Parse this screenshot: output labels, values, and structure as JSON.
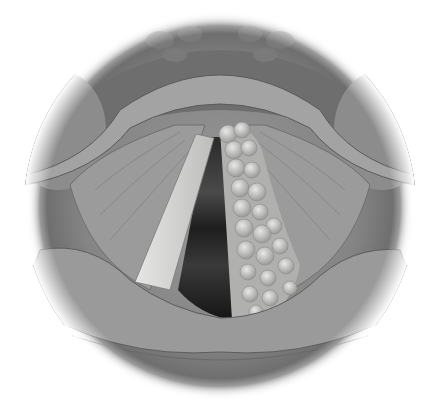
{
  "image": {
    "subject": "larynx-endoscopic-view",
    "description": "Grayscale medical illustration of vocal cords viewed from above; left vocal fold smooth and pale, right vocal fold covered by a nodular growth, dark glottic opening between them, framed within a circular vignette.",
    "style": "grayscale pencil illustration",
    "frame": "circle",
    "colors": {
      "background": "#ffffff",
      "tissue_dark": "#5e5e5e",
      "tissue_mid": "#8a8a8a",
      "tissue_light": "#b5b5b5",
      "fold_pale": "#d8d8d6",
      "nodule": "#c4c4c2",
      "glottis": "#1c1c1c"
    }
  }
}
